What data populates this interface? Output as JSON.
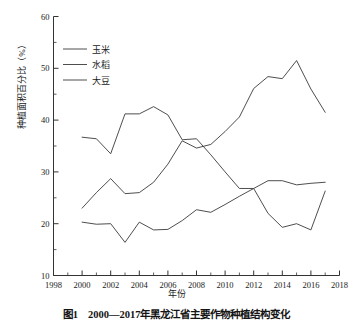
{
  "figure": {
    "ylabel": "种植面积百分比（%）",
    "xlabel": "年份",
    "caption": "图1　2000—2017年黑龙江省主要作物种植结构变化"
  },
  "axes": {
    "y_ticks": [
      "10",
      "20",
      "30",
      "40",
      "50",
      "60"
    ],
    "x_ticks": [
      "1998",
      "2000",
      "2002",
      "2004",
      "2006",
      "2008",
      "2010",
      "2012",
      "2014",
      "2016",
      "2018"
    ]
  },
  "legend": {
    "items": [
      {
        "label": "玉米",
        "color": "#3a3a3a"
      },
      {
        "label": "水稻",
        "color": "#3a3a3a"
      },
      {
        "label": "大豆",
        "color": "#3a3a3a"
      }
    ]
  },
  "chart_data": {
    "type": "line",
    "title": "",
    "xlabel": "年份",
    "ylabel": "种植面积百分比（%）",
    "xlim": [
      1998,
      2018
    ],
    "ylim": [
      10,
      60
    ],
    "grid": false,
    "legend_position": "upper-left",
    "x": [
      2000,
      2001,
      2002,
      2003,
      2004,
      2005,
      2006,
      2007,
      2008,
      2009,
      2010,
      2011,
      2012,
      2013,
      2014,
      2015,
      2016,
      2017
    ],
    "series": [
      {
        "name": "玉米",
        "color": "#3a3a3a",
        "values": [
          23.0,
          26.0,
          28.7,
          25.8,
          26.0,
          28.0,
          31.5,
          36.0,
          34.6,
          35.3,
          37.8,
          40.6,
          46.1,
          48.4,
          48.0,
          51.5,
          46.0,
          41.5
        ]
      },
      {
        "name": "水稻",
        "color": "#3a3a3a",
        "values": [
          36.7,
          36.4,
          33.5,
          41.2,
          41.2,
          42.6,
          41.0,
          36.2,
          36.4,
          33.3,
          30.0,
          26.8,
          26.8,
          28.3,
          28.3,
          27.5,
          27.8,
          28.0
        ]
      },
      {
        "name": "大豆",
        "color": "#3a3a3a",
        "values": [
          20.3,
          19.9,
          20.0,
          16.4,
          20.3,
          18.8,
          18.9,
          20.6,
          22.7,
          22.2,
          23.7,
          25.3,
          26.8,
          22.0,
          19.3,
          20.0,
          18.8,
          26.3
        ]
      }
    ]
  }
}
